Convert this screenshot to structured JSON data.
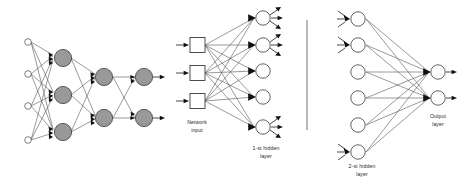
{
  "figure": {
    "background_color": "#ffffff",
    "panels": [
      {
        "id": "left-panel",
        "name": "full-network-overview",
        "description": "Four-layer feedforward network shown in full, with white input nodes and gray processing nodes"
      },
      {
        "id": "middle-panel",
        "name": "input-and-first-hidden-layer-detail",
        "description": "Detail of network input boxes fully connected to the 1-st hidden layer"
      },
      {
        "id": "right-panel",
        "name": "second-hidden-and-output-layer-detail",
        "description": "Detail of the 2-st hidden layer fully connected to the output layer"
      }
    ]
  },
  "labels": {
    "network_input": "Network\ninput",
    "network_input_line1": "Network",
    "network_input_line2": "input",
    "first_hidden_layer_line1": "1-st hidden",
    "first_hidden_layer_line2": "layer",
    "second_hidden_layer_line1": "2-st hidden",
    "second_hidden_layer_line2": "layer",
    "output_layer_line1": "Output",
    "output_layer_line2": "layer"
  },
  "colors": {
    "node_gray_fill": "#999999",
    "node_white_fill": "#ffffff",
    "node_stroke": "#3a3a3a",
    "edge_stroke": "#555555",
    "edge_light_stroke": "#7a7a7a",
    "arrow_fill": "#111111",
    "divider_stroke": "#9a9a9a",
    "text_fill": "#2b2b2b",
    "background": "#ffffff"
  },
  "network_structure": {
    "left_panel": {
      "layer_sizes": [
        4,
        3,
        2,
        2
      ],
      "layer_names": [
        "input",
        "hidden-1",
        "hidden-2",
        "output"
      ],
      "node_styles": [
        "white-small",
        "gray",
        "gray",
        "gray"
      ],
      "node_radius": [
        3.2,
        8.5,
        8.5,
        8.5
      ],
      "layers": [
        {
          "name": "input-layer",
          "cx": 28,
          "cy": [
            42,
            74,
            106,
            140
          ],
          "r": 3.2,
          "fill": "white"
        },
        {
          "name": "hidden-layer-1",
          "cx": 63,
          "cy": [
            58,
            95,
            132
          ],
          "r": 8.6,
          "fill": "gray"
        },
        {
          "name": "hidden-layer-2",
          "cx": 104,
          "cy": [
            77,
            118
          ],
          "r": 8.6,
          "fill": "gray"
        },
        {
          "name": "output-layer",
          "cx": 144,
          "cy": [
            77,
            118
          ],
          "r": 8.6,
          "fill": "gray"
        }
      ],
      "fully_connected": true,
      "output_arrows": 2
    },
    "middle_panel": {
      "input_boxes": {
        "name": "network-input-boxes",
        "count": 3,
        "x": 190,
        "size": 15,
        "cy": [
          45,
          73,
          101
        ],
        "shape": "square",
        "fill": "white"
      },
      "hidden_layer_1": {
        "name": "first-hidden-layer-nodes",
        "count": 5,
        "cx": 263,
        "cy": [
          18,
          45,
          71,
          97,
          127
        ],
        "r": 7.2,
        "fill": "white",
        "nodes_with_output_fan": [
          0,
          1,
          4
        ],
        "output_fan_arrow_count": 3
      },
      "input_arrow_count": 3,
      "fully_connected": true
    },
    "right_panel": {
      "hidden_layer_2": {
        "name": "second-hidden-layer-nodes",
        "count": 6,
        "cx": 358,
        "cy": [
          19,
          45,
          72,
          98,
          125,
          152
        ],
        "r": 7.2,
        "fill": "white",
        "nodes_with_input_fan": [
          0,
          1,
          5
        ],
        "input_fan_arrow_count": 3
      },
      "output_layer": {
        "name": "output-layer-nodes",
        "count": 2,
        "cx": 438,
        "cy": [
          72,
          98
        ],
        "r": 7.2,
        "fill": "white"
      },
      "fully_connected": true,
      "output_arrows": 2
    },
    "divider": {
      "name": "vertical-divider",
      "x": 307,
      "y1": 20,
      "y2": 130
    }
  }
}
